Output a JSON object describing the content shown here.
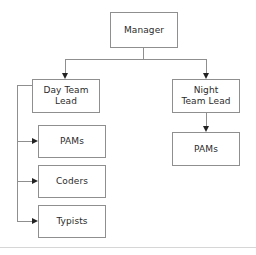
{
  "diagram": {
    "type": "org-chart",
    "title": "",
    "orientation": "top-down",
    "colors": {
      "background": "#ffffff",
      "node_fill": "#ffffff",
      "node_border": "#8f8f8f",
      "connector": "#8f8f8f",
      "arrow": "#222222",
      "text": "#2b2b2b",
      "footer_rule": "#d6d6d6"
    },
    "nodes": [
      {
        "id": "manager",
        "label": "Manager",
        "level": 0
      },
      {
        "id": "day_lead",
        "label": "Day Team\nLead",
        "level": 1
      },
      {
        "id": "night_lead",
        "label": "Night\nTeam Lead",
        "level": 1
      },
      {
        "id": "day_pams",
        "label": "PAMs",
        "level": 2
      },
      {
        "id": "day_coders",
        "label": "Coders",
        "level": 2
      },
      {
        "id": "day_typists",
        "label": "Typists",
        "level": 2
      },
      {
        "id": "night_pams",
        "label": "PAMs",
        "level": 2
      }
    ],
    "edges": [
      {
        "from": "manager",
        "to": "day_lead",
        "arrow": "down"
      },
      {
        "from": "manager",
        "to": "night_lead",
        "arrow": "down"
      },
      {
        "from": "night_lead",
        "to": "night_pams",
        "arrow": "down"
      },
      {
        "from": "day_lead",
        "to": "day_pams",
        "arrow": "right"
      },
      {
        "from": "day_lead",
        "to": "day_coders",
        "arrow": "right"
      },
      {
        "from": "day_lead",
        "to": "day_typists",
        "arrow": "right"
      }
    ]
  }
}
